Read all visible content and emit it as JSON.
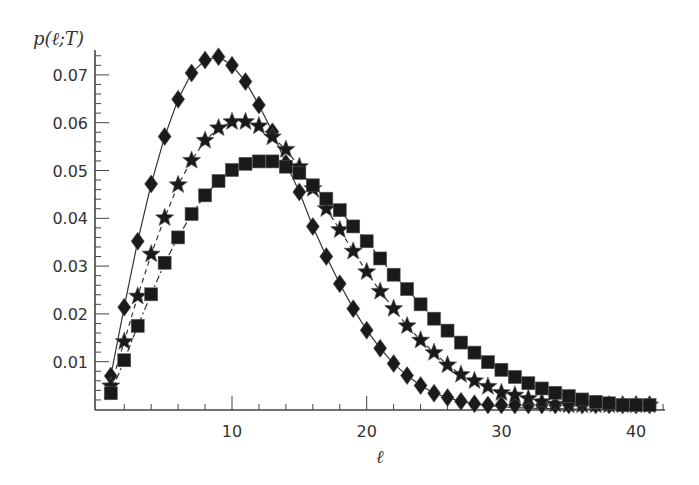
{
  "chart_data": {
    "type": "line",
    "title": "",
    "xlabel": "ℓ",
    "ylabel": "p(ℓ;T)",
    "xlim": [
      0,
      42
    ],
    "ylim": [
      0,
      0.075
    ],
    "grid": false,
    "legend": "none",
    "x_ticks": [
      10,
      20,
      30,
      40
    ],
    "x_tick_labels": [
      "10",
      "20",
      "30",
      "40"
    ],
    "y_ticks": [
      0.01,
      0.02,
      0.03,
      0.04,
      0.05,
      0.06,
      0.07
    ],
    "y_tick_labels": [
      "0.01",
      "0.02",
      "0.03",
      "0.04",
      "0.05",
      "0.06",
      "0.07"
    ],
    "x": [
      1,
      2,
      3,
      4,
      5,
      6,
      7,
      8,
      9,
      10,
      11,
      12,
      13,
      14,
      15,
      16,
      17,
      18,
      19,
      20,
      21,
      22,
      23,
      24,
      25,
      26,
      27,
      28,
      29,
      30,
      31,
      32,
      33,
      34,
      35,
      36,
      37,
      38,
      39,
      40,
      41
    ],
    "series": [
      {
        "name": "diamonds",
        "marker": "diamond",
        "line": "solid",
        "values": [
          0.007,
          0.0214,
          0.0352,
          0.0472,
          0.0571,
          0.0649,
          0.0704,
          0.0731,
          0.0738,
          0.072,
          0.0686,
          0.0637,
          0.0581,
          0.0515,
          0.0455,
          0.0383,
          0.032,
          0.0263,
          0.0211,
          0.0166,
          0.0128,
          0.0096,
          0.0071,
          0.005,
          0.0034,
          0.0025,
          0.0017,
          0.0012,
          0.0008,
          0.0006,
          0.0004,
          0.0003,
          0.0002,
          0.0002,
          0.0001,
          0.0001,
          0.0001,
          0.0001,
          0.0,
          0.0,
          0.0
        ]
      },
      {
        "name": "stars",
        "marker": "star",
        "line": "dashed",
        "values": [
          0.0049,
          0.0142,
          0.0237,
          0.0325,
          0.0401,
          0.047,
          0.0521,
          0.0563,
          0.0589,
          0.0602,
          0.0602,
          0.0593,
          0.057,
          0.0544,
          0.0508,
          0.0462,
          0.042,
          0.0376,
          0.0331,
          0.0288,
          0.0247,
          0.0211,
          0.0175,
          0.0145,
          0.0119,
          0.0093,
          0.0073,
          0.006,
          0.0048,
          0.0035,
          0.003,
          0.0023,
          0.0016,
          0.0011,
          0.0009,
          0.0007,
          0.0005,
          0.0004,
          0.0003,
          0.0002,
          0.0002
        ]
      },
      {
        "name": "squares",
        "marker": "square",
        "line": "dash-dot",
        "values": [
          0.0034,
          0.0103,
          0.0175,
          0.0241,
          0.0307,
          0.036,
          0.0409,
          0.0448,
          0.0478,
          0.0501,
          0.0514,
          0.0519,
          0.0519,
          0.0508,
          0.0495,
          0.0469,
          0.0441,
          0.0417,
          0.0383,
          0.0352,
          0.0316,
          0.0282,
          0.0252,
          0.022,
          0.019,
          0.0165,
          0.014,
          0.0119,
          0.0099,
          0.0083,
          0.0068,
          0.0055,
          0.0044,
          0.0035,
          0.0028,
          0.0021,
          0.0016,
          0.0013,
          0.0009,
          0.0007,
          0.0006
        ]
      }
    ]
  },
  "colors": {
    "axis": "#444444",
    "marker": "#1a1a1a",
    "line": "#333333",
    "text": "#333333"
  }
}
